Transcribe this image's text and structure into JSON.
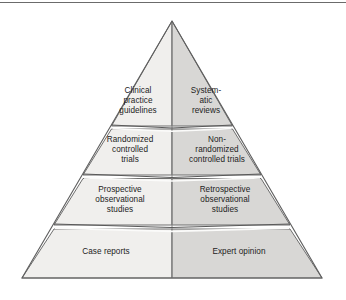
{
  "figure": {
    "name": "evidence-pyramid",
    "apex": {
      "x": 172,
      "y": 21
    },
    "base_left": {
      "x": 22,
      "y": 278
    },
    "base_right": {
      "x": 322,
      "y": 278
    },
    "center_x": 172,
    "tier_boundaries_y": [
      21,
      127,
      176,
      226,
      278
    ],
    "colors": {
      "left_face": "#f0efed",
      "right_face": "#d8d7d5",
      "outline": "#5f5f5f",
      "divider": "#6e6e6e",
      "divider_gap": "#fbfbfa",
      "text": "#1c1c1c",
      "background": "#ffffff",
      "top_rule": "#6b6b6b"
    },
    "tiers": [
      {
        "index": 1,
        "left": {
          "label": "Clinical\npractice\nguidelines"
        },
        "right": {
          "label": "System-\natic\nreviews"
        }
      },
      {
        "index": 2,
        "left": {
          "label": "Randomized\ncontrolled\ntrials"
        },
        "right": {
          "label": "Non-\nrandomized\ncontrolled trials"
        }
      },
      {
        "index": 3,
        "left": {
          "label": "Prospective\nobservational\nstudies"
        },
        "right": {
          "label": "Retrospective\nobservational\nstudies"
        }
      },
      {
        "index": 4,
        "left": {
          "label": "Case reports"
        },
        "right": {
          "label": "Expert opinion"
        }
      }
    ]
  }
}
